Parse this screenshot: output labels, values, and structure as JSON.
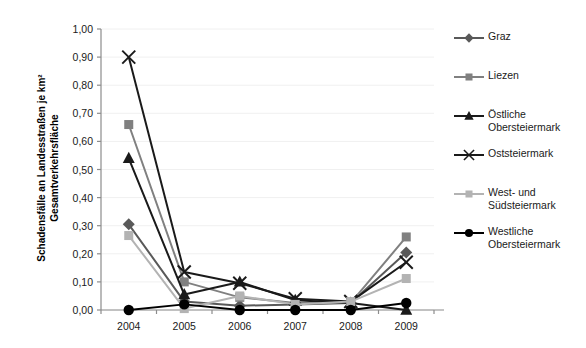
{
  "chart_data": {
    "type": "line",
    "title": "",
    "xlabel": "",
    "ylabel": "Schadensfälle an Landesstraßen je km² Gesamtverkehrsfläche",
    "categories": [
      "2004",
      "2005",
      "2006",
      "2007",
      "2008",
      "2009"
    ],
    "ylim": [
      0.0,
      1.0
    ],
    "ytick_labels": [
      "0,00",
      "0,10",
      "0,20",
      "0,30",
      "0,40",
      "0,50",
      "0,60",
      "0,70",
      "0,80",
      "0,90",
      "1,00"
    ],
    "ytick_values": [
      0.0,
      0.1,
      0.2,
      0.3,
      0.4,
      0.5,
      0.6,
      0.7,
      0.8,
      0.9,
      1.0
    ],
    "grid": false,
    "legend_position": "right",
    "series": [
      {
        "name": "Graz",
        "marker": "diamond",
        "color": "#595959",
        "values": [
          0.305,
          0.03,
          0.015,
          0.02,
          0.025,
          0.205
        ]
      },
      {
        "name": "Liezen",
        "marker": "square",
        "color": "#808080",
        "values": [
          0.66,
          0.1,
          0.045,
          0.025,
          0.025,
          0.26
        ]
      },
      {
        "name": "Östliche Obersteiermark",
        "marker": "triangle",
        "color": "#1a1a1a",
        "values": [
          0.54,
          0.055,
          0.1,
          0.035,
          0.025,
          0.0
        ]
      },
      {
        "name": "Oststeiermark",
        "marker": "cross",
        "color": "#1a1a1a",
        "values": [
          0.9,
          0.135,
          0.095,
          0.04,
          0.03,
          0.17
        ]
      },
      {
        "name": "West- und Südsteiermark",
        "marker": "square",
        "color": "#b3b3b3",
        "values": [
          0.265,
          0.005,
          0.05,
          0.02,
          0.03,
          0.112
        ]
      },
      {
        "name": "Westliche Obersteiermark",
        "marker": "circle",
        "color": "#000000",
        "values": [
          0.0,
          0.02,
          0.0,
          0.0,
          0.0,
          0.025
        ]
      }
    ]
  }
}
